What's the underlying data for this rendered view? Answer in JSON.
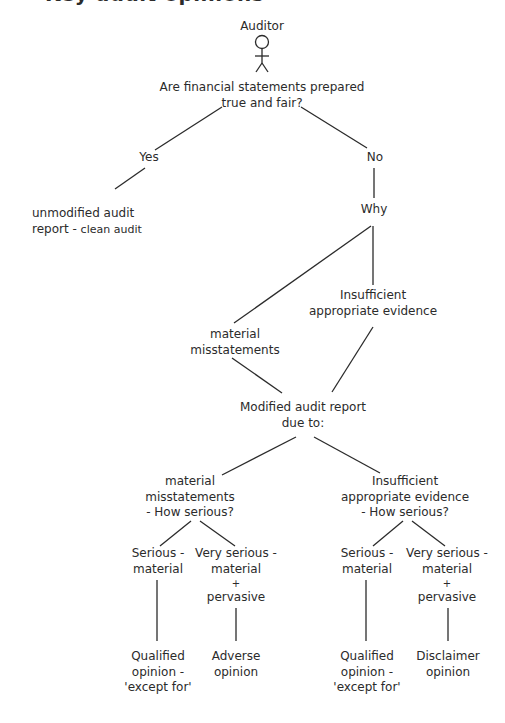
{
  "title": {
    "text": "Key audit opinions",
    "clipped": true
  },
  "actor": {
    "label": "Auditor",
    "icon": "stick-figure-icon"
  },
  "question": {
    "lines": [
      "Are financial statements prepared",
      "true and fair?"
    ]
  },
  "branches": {
    "yes": {
      "label": "Yes",
      "outcome": {
        "line1": "unmodified audit",
        "line2_main": "report - ",
        "line2_small": "clean audit"
      }
    },
    "no": {
      "label": "No",
      "why": "Why",
      "reasons": {
        "misstatements": [
          "material",
          "misstatements"
        ],
        "insufficient": [
          "Insufficient",
          "appropriate evidence"
        ]
      }
    }
  },
  "modified_report": {
    "lines": [
      "Modified audit report",
      "due to:"
    ]
  },
  "severity_groups": [
    {
      "heading": [
        "material",
        "misstatements",
        "- How serious?"
      ],
      "options": [
        {
          "severity": [
            "Serious -",
            "material"
          ],
          "opinion": [
            "Qualified",
            "opinion -",
            "'except for'"
          ]
        },
        {
          "severity": [
            "Very serious -",
            "material",
            "+",
            "pervasive"
          ],
          "opinion": [
            "Adverse",
            "opinion"
          ]
        }
      ]
    },
    {
      "heading": [
        "Insufficient",
        "appropriate evidence",
        "- How serious?"
      ],
      "options": [
        {
          "severity": [
            "Serious -",
            "material"
          ],
          "opinion": [
            "Qualified",
            "opinion -",
            "'except for'"
          ]
        },
        {
          "severity": [
            "Very serious -",
            "material",
            "+",
            "pervasive"
          ],
          "opinion": [
            "Disclaimer",
            "opinion"
          ]
        }
      ]
    }
  ],
  "colors": {
    "ink": "#2b2b2b",
    "background": "#ffffff"
  }
}
